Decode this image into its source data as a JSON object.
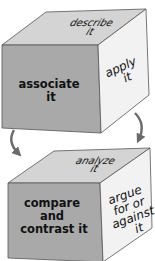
{
  "diagram": {
    "cubes": [
      {
        "name": "top",
        "faces": {
          "top": [
            "describe",
            "it"
          ],
          "front": [
            "associate",
            "it"
          ],
          "right": [
            "apply",
            "it"
          ]
        }
      },
      {
        "name": "bottom",
        "faces": {
          "top": [
            "analyze",
            "it"
          ],
          "front": [
            "compare",
            "and",
            "contrast it"
          ],
          "right": [
            "argue",
            "for or",
            "against",
            "it"
          ]
        }
      }
    ],
    "arrows": [
      {
        "name": "rotate-left",
        "direction": "down"
      },
      {
        "name": "rotate-right",
        "direction": "down"
      }
    ],
    "colors": {
      "front_face": "#a9a9a9",
      "top_face": "#d4d4d4",
      "right_face": "#f2f2f2",
      "edge": "#555555",
      "arrow": "#6b6b6b",
      "text": "#111111"
    }
  }
}
